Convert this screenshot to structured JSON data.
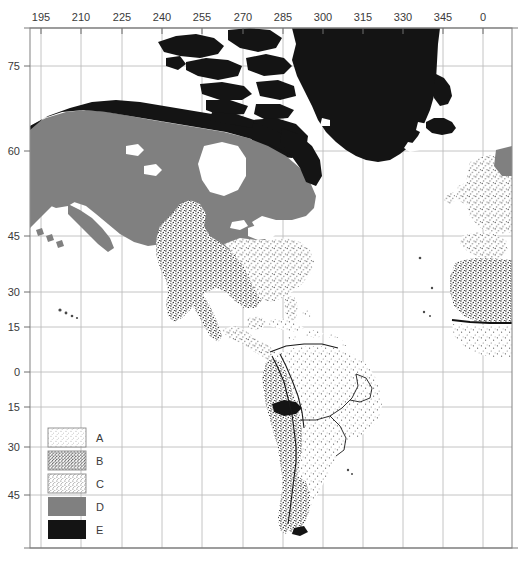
{
  "figure": {
    "type": "map",
    "title": "",
    "projection_note": "",
    "background_color": "#ffffff"
  },
  "axes": {
    "top_axis": {
      "name": "longitude",
      "labels": [
        "195",
        "210",
        "225",
        "240",
        "255",
        "270",
        "285",
        "300",
        "315",
        "330",
        "345",
        "0"
      ],
      "values": [
        195,
        210,
        225,
        240,
        255,
        270,
        285,
        300,
        315,
        330,
        345,
        0
      ],
      "positions_px": [
        41,
        81,
        122,
        162,
        202,
        243,
        283,
        323,
        363,
        403,
        443,
        483
      ]
    },
    "left_axis": {
      "name": "latitude",
      "labels": [
        "75",
        "60",
        "45",
        "30",
        "15",
        "0",
        "15",
        "30",
        "45"
      ],
      "values": [
        75,
        60,
        45,
        30,
        15,
        0,
        -15,
        -30,
        -45
      ],
      "positions_px": [
        66,
        151,
        236,
        292,
        327,
        372,
        407,
        447,
        495
      ]
    },
    "grid": "on",
    "grid_color": "#b9b9b9",
    "frame_color": "#8c8c8c"
  },
  "legend": {
    "name": "climate-class-legend",
    "position": "lower-left",
    "entries": [
      {
        "key": "A",
        "label": "A",
        "pattern": "sparse-light-stipple",
        "fill": "#f4f4f4"
      },
      {
        "key": "B",
        "label": "B",
        "pattern": "dense-dark-stipple",
        "fill": "#d2d2d2"
      },
      {
        "key": "C",
        "label": "C",
        "pattern": "medium-stipple",
        "fill": "#ececec"
      },
      {
        "key": "D",
        "label": "D",
        "pattern": "solid-gray",
        "fill": "#808080"
      },
      {
        "key": "E",
        "label": "E",
        "pattern": "solid-black",
        "fill": "#141414"
      }
    ]
  },
  "regions": [
    {
      "name": "greenland",
      "class": "E"
    },
    {
      "name": "canadian-arctic-archipelago",
      "class": "E"
    },
    {
      "name": "northern-canada-tundra",
      "class": "E"
    },
    {
      "name": "iceland",
      "class": "E"
    },
    {
      "name": "alaska-interior",
      "class": "D"
    },
    {
      "name": "boreal-canada",
      "class": "D"
    },
    {
      "name": "great-basin-interior",
      "class": "D"
    },
    {
      "name": "scandinavia-edge",
      "class": "D"
    },
    {
      "name": "western-united-states",
      "class": "B"
    },
    {
      "name": "northern-mexico",
      "class": "B"
    },
    {
      "name": "sahara",
      "class": "B"
    },
    {
      "name": "andes-patagonia",
      "class": "B"
    },
    {
      "name": "eastern-united-states",
      "class": "C"
    },
    {
      "name": "western-europe",
      "class": "C"
    },
    {
      "name": "central-america",
      "class": "C"
    },
    {
      "name": "amazon-basin",
      "class": "A"
    },
    {
      "name": "caribbean-islands",
      "class": "A"
    },
    {
      "name": "west-africa-coast",
      "class": "A"
    },
    {
      "name": "high-andes-peak",
      "class": "E"
    }
  ]
}
